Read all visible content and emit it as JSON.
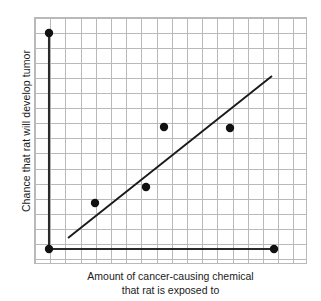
{
  "chart_data": {
    "type": "scatter",
    "title": "",
    "subtitle": "",
    "xlabel_line1": "Amount of cancer-causing chemical",
    "xlabel_line2": "that rat is exposed to",
    "ylabel": "Chance that rat will develop tumor",
    "grid": true,
    "legend": "none",
    "axis_ticks": "none",
    "xlim": [
      0,
      18
    ],
    "ylim": [
      0,
      16.4
    ],
    "grid_cell_px": 15,
    "marker_color": "#111111",
    "grid_color": "#b9b9b9",
    "line_color": "#1a1a1a",
    "points": [
      {
        "name": "point-top-left",
        "x": 1.0,
        "y": 14.35,
        "px": 49,
        "py": 33
      },
      {
        "name": "point-bottom-left",
        "x": 1.0,
        "y": 1.0,
        "px": 49,
        "py": 249
      },
      {
        "name": "point-low-left",
        "x": 4.0,
        "y": 4.05,
        "px": 95,
        "py": 203
      },
      {
        "name": "point-mid-low",
        "x": 7.4,
        "y": 5.1,
        "px": 146,
        "py": 187
      },
      {
        "name": "point-mid-high",
        "x": 8.55,
        "y": 9.1,
        "px": 164,
        "py": 127
      },
      {
        "name": "point-right-high",
        "x": 12.9,
        "y": 9.05,
        "px": 230,
        "py": 128
      },
      {
        "name": "point-bottom-right",
        "x": 15.8,
        "y": 1.0,
        "px": 274,
        "py": 249
      }
    ],
    "trend_line": {
      "name": "best-fit-line",
      "x1": 2.25,
      "y1": 1.75,
      "x2": 15.65,
      "y2": 12.5,
      "px1": 68,
      "py1": 238,
      "px2": 272,
      "py2": 76
    },
    "connector_lines": [
      {
        "name": "left-vertical-connector",
        "px1": 49,
        "py1": 33,
        "px2": 49,
        "py2": 249
      },
      {
        "name": "bottom-horizontal-connector",
        "px1": 49,
        "py1": 249,
        "px2": 274,
        "py2": 249
      }
    ],
    "marker_radius_px": 4.2
  }
}
